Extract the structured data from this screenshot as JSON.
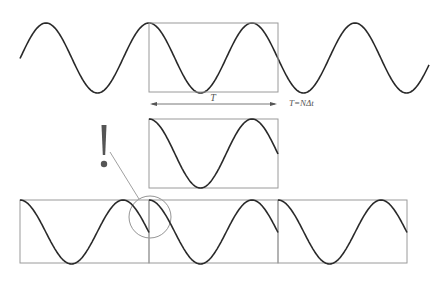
{
  "diagram": {
    "labels": {
      "window_length": "T",
      "window_formula": "T=NΔt",
      "warning_mark": "!"
    },
    "colors": {
      "wave": "#2a2a2a",
      "box": "#9a9a9a",
      "text": "#555555",
      "warning": "#555555"
    },
    "panels": [
      {
        "name": "original-signal",
        "description": "Continuous sinusoid with observation window box"
      },
      {
        "name": "windowed-segment",
        "description": "Segment of length T extracted by window"
      },
      {
        "name": "periodic-extension",
        "description": "Segment repeated three times showing discontinuity at boundaries"
      }
    ]
  }
}
